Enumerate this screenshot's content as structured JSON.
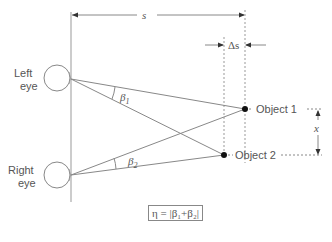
{
  "labels": {
    "left_eye_line1": "Left",
    "left_eye_line2": "eye",
    "right_eye_line1": "Right",
    "right_eye_line2": "eye",
    "distance": "s",
    "delta_distance": "Δs",
    "beta1": "β",
    "beta1_sub": "1",
    "beta2": "β",
    "beta2_sub": "2",
    "object1": "Object 1",
    "object2": "Object 2",
    "separation": "x",
    "formula": "η = |β₁+β₂|"
  },
  "colors": {
    "line": "#888888",
    "text": "#555555",
    "dot": "#111111"
  }
}
